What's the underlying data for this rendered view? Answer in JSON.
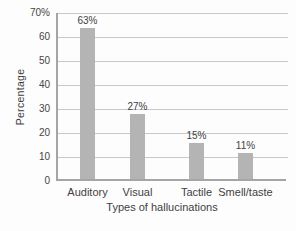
{
  "chart_data": {
    "type": "bar",
    "title": "",
    "categories": [
      "Auditory",
      "Visual",
      "Tactile",
      "Smell/taste"
    ],
    "values": [
      63,
      27,
      15,
      11
    ],
    "value_labels": [
      "63%",
      "27%",
      "15%",
      "11%"
    ],
    "xlabel": "Types of hallucinations",
    "ylabel": "Percentage",
    "ylim": [
      0,
      70
    ],
    "ytick_step": 10,
    "ytick_labels_top_to_bottom": [
      "70%",
      "60",
      "50",
      "40",
      "30",
      "20",
      "10",
      "0"
    ],
    "grid": true,
    "legend": "none",
    "colors": {
      "bar": "#b4b4b4",
      "gridline": "#c8c8c8",
      "axis": "#a5a5a5",
      "text": "#3f3f3f",
      "background": "#fdfdfd"
    }
  }
}
